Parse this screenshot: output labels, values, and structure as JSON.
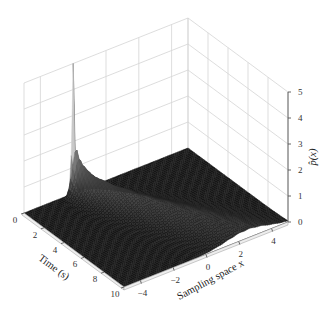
{
  "chart_data": {
    "type": "surface3d",
    "title": "",
    "axes": {
      "time": {
        "label": "Time (s)",
        "range": [
          0,
          10
        ],
        "ticks": [
          0,
          2,
          4,
          6,
          8,
          10
        ],
        "tick_labels": [
          "0",
          "2",
          "4",
          "6",
          "8",
          "10"
        ]
      },
      "x": {
        "label": "Sampling space x",
        "range": [
          -5,
          5
        ],
        "ticks": [
          -4,
          -2,
          0,
          2,
          4
        ],
        "tick_labels": [
          "−4",
          "−2",
          "0",
          "2",
          "4"
        ]
      },
      "z": {
        "label": "p̂(x)",
        "range": [
          0,
          5
        ],
        "ticks": [
          0,
          1,
          2,
          3,
          4,
          5
        ],
        "tick_labels": [
          "0",
          "1",
          "2",
          "3",
          "4",
          "5"
        ]
      }
    },
    "surface_model": {
      "peak_time": 0,
      "peak_x_center": -2.0,
      "peak_height": 5.0,
      "drift_per_second": 0.45,
      "initial_sigma": 0.08,
      "sigma_growth": 0.17
    },
    "sample_points": [
      {
        "t": 0.0,
        "x": -2.0,
        "p": 5.0
      },
      {
        "t": 0.5,
        "x": -1.8,
        "p": 2.9
      },
      {
        "t": 1.0,
        "x": -1.55,
        "p": 2.1
      },
      {
        "t": 2.0,
        "x": -1.1,
        "p": 1.3
      },
      {
        "t": 4.0,
        "x": -0.2,
        "p": 0.7
      },
      {
        "t": 6.0,
        "x": 0.7,
        "p": 0.5
      },
      {
        "t": 8.0,
        "x": 1.6,
        "p": 0.4
      },
      {
        "t": 10.0,
        "x": 2.5,
        "p": 0.3
      }
    ],
    "colormap": "grayscale (dark at 0, light at peak)",
    "grid": true,
    "legend": null,
    "view": {
      "elevation_deg": 30,
      "azimuth_deg": -37.5
    }
  },
  "projection": {
    "floor_back": [
      176,
      138
    ],
    "floor_left": [
      24,
      213
    ],
    "floor_front": [
      124,
      287
    ],
    "floor_right": [
      288,
      222
    ],
    "z_unit_px": 26
  }
}
